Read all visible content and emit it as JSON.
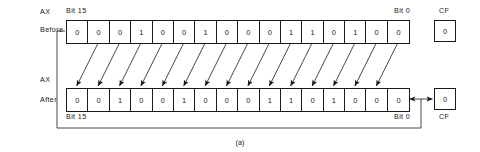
{
  "figure": {
    "caption": "(a)",
    "operation": "rotate-left-through-carry"
  },
  "rows": {
    "before": {
      "register_label": "AX",
      "state_label": "Before",
      "msb_label": "Bit 15",
      "lsb_label": "Bit 0",
      "flag_label": "CF",
      "bits": [
        "0",
        "0",
        "0",
        "1",
        "0",
        "0",
        "1",
        "0",
        "0",
        "0",
        "1",
        "1",
        "0",
        "1",
        "0",
        "0"
      ],
      "flag_value": "0"
    },
    "after": {
      "register_label": "AX",
      "state_label": "After",
      "msb_label": "Bit 15",
      "lsb_label": "Bit 0",
      "flag_label": "CF",
      "bits": [
        "0",
        "0",
        "1",
        "0",
        "0",
        "1",
        "0",
        "0",
        "0",
        "1",
        "1",
        "0",
        "1",
        "0",
        "0",
        "0"
      ],
      "flag_value": "0"
    }
  },
  "colors": {
    "line": "#1a1a1a",
    "fill": "#ffffff",
    "text": "#1a1a1a"
  }
}
